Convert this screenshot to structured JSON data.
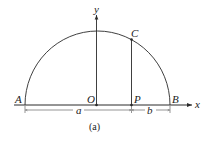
{
  "figure": {
    "caption": "(a)",
    "colors": {
      "stroke": "#2a2a2a",
      "background": "#ffffff"
    },
    "axes": {
      "x_label": "x",
      "y_label": "y"
    },
    "points": {
      "A": "A",
      "B": "B",
      "O": "O",
      "P": "P",
      "C": "C"
    },
    "dimensions": {
      "a": "a",
      "b": "b"
    },
    "shape": "semicircle"
  }
}
